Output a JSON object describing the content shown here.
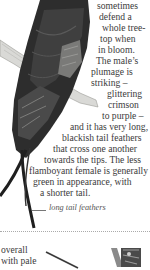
{
  "body_text": {
    "lines": [
      "sometimes",
      "defend a",
      "whole tree-",
      "top when",
      "in bloom.",
      "The male’s",
      "plumage is",
      "striking –",
      "glittering",
      "crimson",
      "to purple –",
      "and it has very long,",
      "blackish tail feathers",
      "that cross one another",
      "towards the tips. The less",
      "flamboyant female is generally",
      "green in appearance, with",
      "a shorter tail."
    ]
  },
  "annotation": {
    "label": "long tail feathers"
  },
  "next_section": {
    "lines": [
      "overall",
      "with pale"
    ]
  },
  "illustrations": {
    "main": "bird-illustration-sunbird",
    "thumbnail": "bird-thumbnail"
  }
}
